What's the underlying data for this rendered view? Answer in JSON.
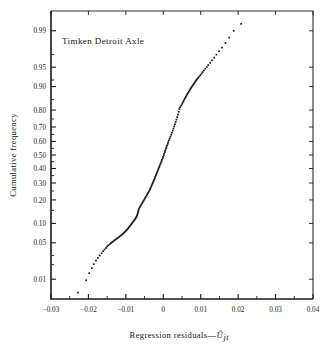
{
  "chart_data": {
    "type": "scatter",
    "title": "",
    "annotation": "Timken Detroit Axle",
    "xlabel": "Regression residuals—Ûⱼₜ",
    "xlabel_plain": "Regression residuals",
    "xlabel_symbol": "Û",
    "xlabel_subscript": "jt",
    "ylabel": "Cumulative frequency",
    "yscale": "probit",
    "xlim": [
      -0.03,
      0.04
    ],
    "ylim": [
      0.003,
      0.995
    ],
    "grid": false,
    "legend": false,
    "xticks": [
      -0.03,
      -0.02,
      -0.01,
      0,
      0.01,
      0.02,
      0.03,
      0.04
    ],
    "xticklabels": [
      "−0.03",
      "−0.02",
      "−0.01",
      "0",
      "0.01",
      "0.02",
      "0.03",
      "0.04"
    ],
    "yticks": [
      0.01,
      0.05,
      0.1,
      0.2,
      0.3,
      0.4,
      0.5,
      0.6,
      0.7,
      0.8,
      0.9,
      0.95,
      0.99
    ],
    "yticklabels": [
      "0.01",
      "0.05",
      "0.10",
      "0.20",
      "0.30",
      "0.40",
      "0.50",
      "0.60",
      "0.70",
      "0.80",
      "0.90",
      "0.95",
      "0.99"
    ],
    "yminorticks": [
      0.02,
      0.03,
      0.15,
      0.25,
      0.35,
      0.45,
      0.55,
      0.65,
      0.75,
      0.85,
      0.92,
      0.97
    ],
    "point_color": "#141414",
    "axis_color": "#1a1a1a",
    "series": [
      {
        "name": "Cumulative frequency of regression residuals",
        "x": [
          -0.0228,
          -0.0206,
          -0.0198,
          -0.0191,
          -0.0186,
          -0.018,
          -0.0175,
          -0.017,
          -0.0165,
          -0.0161,
          -0.0157,
          -0.0153,
          -0.015,
          -0.0147,
          -0.0143,
          -0.014,
          -0.0137,
          -0.0134,
          -0.0131,
          -0.0128,
          -0.0125,
          -0.0122,
          -0.0119,
          -0.0116,
          -0.0113,
          -0.011,
          -0.0108,
          -0.0105,
          -0.0103,
          -0.01,
          -0.0098,
          -0.0096,
          -0.0094,
          -0.0092,
          -0.009,
          -0.0088,
          -0.0086,
          -0.0084,
          -0.0082,
          -0.008,
          -0.0078,
          -0.0076,
          -0.0074,
          -0.0073,
          -0.0071,
          -0.007,
          -0.0069,
          -0.0068,
          -0.0067,
          -0.0066,
          -0.0065,
          -0.0063,
          -0.0061,
          -0.0059,
          -0.0057,
          -0.0055,
          -0.0053,
          -0.0051,
          -0.0049,
          -0.0047,
          -0.0045,
          -0.0043,
          -0.0041,
          -0.0039,
          -0.0037,
          -0.0035,
          -0.0034,
          -0.0032,
          -0.0031,
          -0.0029,
          -0.0028,
          -0.0026,
          -0.0025,
          -0.0023,
          -0.0022,
          -0.002,
          -0.0019,
          -0.0017,
          -0.0016,
          -0.0014,
          -0.0013,
          -0.0011,
          -0.001,
          -0.0008,
          -0.0007,
          -0.0005,
          -0.0004,
          -0.0002,
          -0.0001,
          0.0001,
          0.0002,
          0.0004,
          0.0005,
          0.0007,
          0.0008,
          0.001,
          0.0012,
          0.0013,
          0.0015,
          0.0017,
          0.0019,
          0.0021,
          0.0023,
          0.0025,
          0.0027,
          0.0029,
          0.0031,
          0.0033,
          0.0035,
          0.0037,
          0.0039,
          0.0041,
          0.0043,
          0.0045,
          0.0048,
          0.005,
          0.0052,
          0.0054,
          0.0056,
          0.0058,
          0.006,
          0.0062,
          0.0064,
          0.0066,
          0.0068,
          0.007,
          0.0072,
          0.0074,
          0.0076,
          0.0078,
          0.008,
          0.0082,
          0.0084,
          0.0086,
          0.0088,
          0.009,
          0.0093,
          0.0096,
          0.0099,
          0.0102,
          0.0105,
          0.0108,
          0.0112,
          0.0116,
          0.012,
          0.0125,
          0.013,
          0.0136,
          0.0142,
          0.0149,
          0.0157,
          0.0166,
          0.0176,
          0.0188,
          0.0208
        ],
        "y": [
          0.005,
          0.0095,
          0.0135,
          0.017,
          0.0205,
          0.024,
          0.027,
          0.03,
          0.033,
          0.036,
          0.0385,
          0.041,
          0.0435,
          0.0455,
          0.0475,
          0.0495,
          0.0512,
          0.053,
          0.0548,
          0.0566,
          0.0584,
          0.0603,
          0.0622,
          0.0642,
          0.0662,
          0.0683,
          0.0705,
          0.0727,
          0.075,
          0.0775,
          0.08,
          0.0826,
          0.0853,
          0.0881,
          0.091,
          0.094,
          0.0971,
          0.1003,
          0.1036,
          0.107,
          0.1105,
          0.1141,
          0.1178,
          0.1216,
          0.1255,
          0.13,
          0.135,
          0.1405,
          0.146,
          0.152,
          0.158,
          0.164,
          0.17,
          0.1762,
          0.1825,
          0.189,
          0.1956,
          0.2024,
          0.2093,
          0.2164,
          0.2236,
          0.231,
          0.2385,
          0.2462,
          0.254,
          0.262,
          0.2701,
          0.2784,
          0.2868,
          0.2954,
          0.3041,
          0.313,
          0.322,
          0.3312,
          0.3405,
          0.35,
          0.3596,
          0.3694,
          0.3793,
          0.3894,
          0.3996,
          0.41,
          0.4205,
          0.4312,
          0.442,
          0.453,
          0.4641,
          0.4754,
          0.4868,
          0.4984,
          0.5101,
          0.522,
          0.534,
          0.5462,
          0.5585,
          0.571,
          0.5836,
          0.5964,
          0.6093,
          0.6224,
          0.6356,
          0.649,
          0.6625,
          0.6762,
          0.69,
          0.704,
          0.7181,
          0.7324,
          0.7468,
          0.7614,
          0.7761,
          0.791,
          0.806,
          0.815,
          0.823,
          0.8305,
          0.8375,
          0.8442,
          0.8505,
          0.8565,
          0.8622,
          0.8676,
          0.8728,
          0.8777,
          0.8824,
          0.8869,
          0.8912,
          0.8953,
          0.8992,
          0.903,
          0.9066,
          0.91,
          0.9133,
          0.9165,
          0.9196,
          0.9225,
          0.926,
          0.9295,
          0.933,
          0.9365,
          0.94,
          0.9435,
          0.947,
          0.9505,
          0.954,
          0.958,
          0.962,
          0.966,
          0.97,
          0.974,
          0.978,
          0.982,
          0.986,
          0.99,
          0.993
        ]
      }
    ]
  }
}
